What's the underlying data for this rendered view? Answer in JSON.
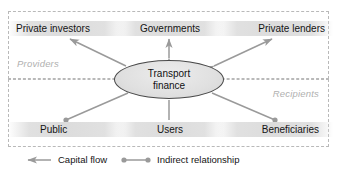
{
  "diagram": {
    "title": "Transport finance",
    "zones": [
      {
        "id": "providers",
        "label": "Providers"
      },
      {
        "id": "recipients",
        "label": "Recipients"
      }
    ],
    "center": {
      "line1": "Transport",
      "line2": "finance"
    },
    "nodes": [
      {
        "id": "private-investors",
        "label": "Private investors",
        "zone": "providers",
        "connector": "capital-flow-out"
      },
      {
        "id": "governments",
        "label": "Governments",
        "zone": "providers",
        "connector": "capital-flow-bidirectional"
      },
      {
        "id": "private-lenders",
        "label": "Private lenders",
        "zone": "providers",
        "connector": "capital-flow-bidirectional"
      },
      {
        "id": "public",
        "label": "Public",
        "zone": "recipients",
        "connector": "indirect-relationship"
      },
      {
        "id": "users",
        "label": "Users",
        "zone": "recipients",
        "connector": "plain-line"
      },
      {
        "id": "beneficiaries",
        "label": "Beneficiaries",
        "zone": "recipients",
        "connector": "indirect-relationship"
      }
    ],
    "legend": [
      {
        "id": "capital-flow",
        "label": "Capital flow",
        "symbol": "arrow-line"
      },
      {
        "id": "indirect-relationship",
        "label": "Indirect relationship",
        "symbol": "dotted-end-line"
      }
    ],
    "colors": {
      "connector": "#9a9a9a",
      "zone_border": "#b9b9b9",
      "zone_label": "#b0b0b0",
      "node_band": "#dcdcdc",
      "center_fill": "#e2e2e2",
      "center_stroke": "#4a4a4a",
      "text": "#141414",
      "background": "#ffffff"
    }
  }
}
